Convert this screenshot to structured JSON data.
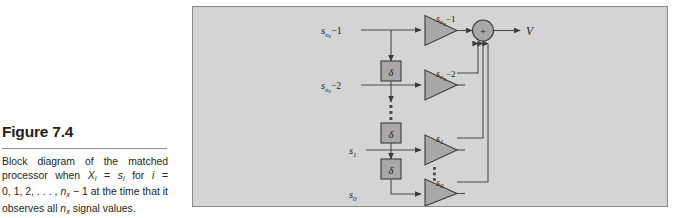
{
  "caption": {
    "title": "Figure 7.4",
    "line1_part1": "Block diagram of the matched",
    "line2_pre": "processor when ",
    "line2_x": "X",
    "line2_xsub": "i",
    "line2_eq": " = ",
    "line2_s": "s",
    "line2_ssub": "i",
    "line2_for": " for ",
    "line2_i": "i",
    "line2_eq2": " =",
    "line3_nums": "0, 1, 2, . . . , ",
    "line3_n": "n",
    "line3_nsub": "x",
    "line3_rest": " − 1 at the time that it",
    "line4_pre": "observes all ",
    "line4_n": "n",
    "line4_nsub": "x",
    "line4_rest": " signal values."
  },
  "figure": {
    "panel_background": "#d4d4d4",
    "panel_border": "#8a8a8a",
    "shape_fill": "#a8a8a8",
    "wire_color": "#4a4a4a",
    "delay_label": "δ",
    "summer_label": "+",
    "output_label": "V",
    "rows": [
      {
        "input_label_base": "s",
        "input_label_sub": "n",
        "input_label_subsub": "x",
        "input_label_tail": "−1",
        "amp_label_base": "s",
        "amp_label_sub": "n",
        "amp_label_subsub": "x",
        "amp_label_tail": "−1"
      },
      {
        "input_label_base": "s",
        "input_label_sub": "n",
        "input_label_subsub": "x",
        "input_label_tail": "−2",
        "amp_label_base": "s",
        "amp_label_sub": "n",
        "amp_label_subsub": "x",
        "amp_label_tail": "−2"
      },
      {
        "input_label_base": "s",
        "input_label_sub": "1",
        "input_label_subsub": "",
        "input_label_tail": "",
        "amp_label_base": "s",
        "amp_label_sub": "1",
        "amp_label_subsub": "",
        "amp_label_tail": ""
      },
      {
        "input_label_base": "s",
        "input_label_sub": "0",
        "input_label_subsub": "",
        "input_label_tail": "",
        "amp_label_base": "s",
        "amp_label_sub": "0",
        "amp_label_subsub": "",
        "amp_label_tail": ""
      }
    ]
  }
}
